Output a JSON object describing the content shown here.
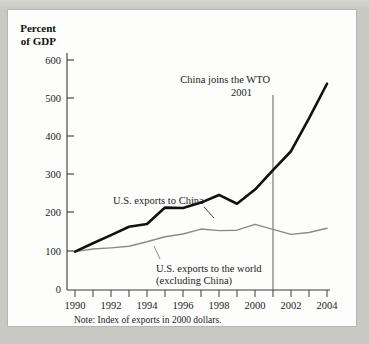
{
  "figure": {
    "y_axis_title_line1": "Percent",
    "y_axis_title_line2": "of GDP",
    "note": "Note: Index of exports in 2000 dollars.",
    "annotation_line1": "China joins the WTO",
    "annotation_line2": "2001",
    "label_china": "U.S. exports to China",
    "label_world_line1": "U.S. exports to the world",
    "label_world_line2": "(excluding China)",
    "colors": {
      "series_china": "#111111",
      "series_world": "#8a8a8a",
      "axis": "#3a3a3a",
      "page_background": "#c9c9c4",
      "card_background": "#fdfdfb"
    }
  },
  "chart_data": {
    "type": "line",
    "title": "",
    "subtitle": "",
    "xlabel": "",
    "ylabel": "Percent of GDP",
    "note": "Note: Index of exports in 2000 dollars.",
    "grid": false,
    "legend": "inline-annotations",
    "xlim": [
      1990,
      2004
    ],
    "ylim": [
      0,
      600
    ],
    "ytick_values": [
      0,
      100,
      200,
      300,
      400,
      500,
      600
    ],
    "ytick_labels": [
      "0",
      "100",
      "200",
      "300",
      "400",
      "500",
      "600"
    ],
    "xtick_values": [
      1990,
      1991,
      1992,
      1993,
      1994,
      1995,
      1996,
      1997,
      1998,
      1999,
      2000,
      2001,
      2002,
      2003,
      2004
    ],
    "xtick_labels_shown": [
      "1990",
      "1992",
      "1994",
      "1996",
      "1998",
      "2000",
      "2002",
      "2004"
    ],
    "x": [
      1990,
      1991,
      1992,
      1993,
      1994,
      1995,
      1996,
      1997,
      1998,
      1999,
      2000,
      2001,
      2002,
      2003,
      2004
    ],
    "series": [
      {
        "name": "U.S. exports to China",
        "color": "#111111",
        "width": 2.6,
        "values": [
          100,
          122,
          143,
          165,
          172,
          215,
          214,
          228,
          248,
          225,
          262,
          313,
          362,
          448,
          538
        ]
      },
      {
        "name": "U.S. exports to the world (excluding China)",
        "color": "#8a8a8a",
        "width": 1.4,
        "values": [
          100,
          107,
          110,
          114,
          126,
          139,
          146,
          159,
          155,
          156,
          171,
          158,
          145,
          150,
          161
        ]
      }
    ],
    "annotations": [
      {
        "text": "China joins the WTO 2001",
        "type": "vertical-line-with-label",
        "x": 2001,
        "label_lines": [
          "China joins the WTO",
          "2001"
        ]
      },
      {
        "text": "U.S. exports to China",
        "type": "leader-label",
        "points_to_x": 1997
      },
      {
        "text": "U.S. exports to the world (excluding China)",
        "type": "leader-label",
        "points_to_x": 1994
      }
    ]
  }
}
